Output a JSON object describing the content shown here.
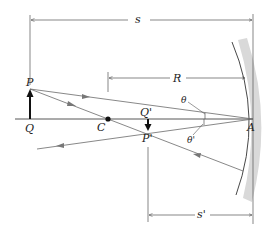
{
  "diagram": {
    "labels": {
      "object_tip": "P",
      "object_base": "Q",
      "center": "C",
      "image_base": "Q'",
      "image_tip": "P'",
      "vertex": "A",
      "incidence_angle": "θ",
      "reflection_angle": "θ'"
    },
    "dimensions": {
      "object_distance": "s",
      "radius": "R",
      "image_distance": "s'"
    },
    "colors": {
      "line": "#555555",
      "ray": "#6a6a6a",
      "mirror_band": "#d9d9d9",
      "mirror_edge": "#333333",
      "arrow_fill": "#111111"
    }
  }
}
